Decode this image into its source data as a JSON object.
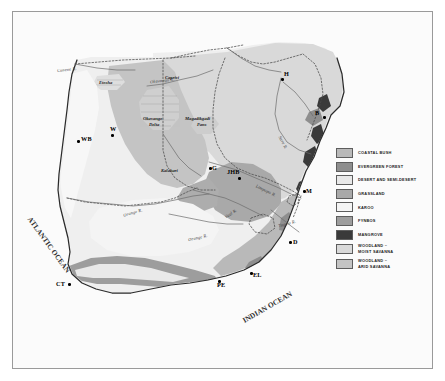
{
  "map": {
    "title": "Southern Africa Vegetation Map",
    "oceans": [
      {
        "name": "atlantic",
        "text": "ATLANTIC OCEAN"
      },
      {
        "name": "indian",
        "text": "INDIAN OCEAN"
      }
    ],
    "rivers": [
      {
        "label": "Cunene R.",
        "x": 44,
        "y": 57
      },
      {
        "label": "Okavango R.",
        "x": 137,
        "y": 70
      },
      {
        "label": "Save R.",
        "x": 266,
        "y": 132
      },
      {
        "label": "Limpopo R.",
        "x": 243,
        "y": 178
      },
      {
        "label": "Vaal R.",
        "x": 212,
        "y": 203
      },
      {
        "label": "Tugela R.",
        "x": 268,
        "y": 212
      },
      {
        "label": "Orange R.",
        "x": 112,
        "y": 201
      },
      {
        "label": "Orange R.",
        "x": 176,
        "y": 226
      }
    ],
    "features": [
      {
        "label": "Etosha",
        "x": 92,
        "y": 71
      },
      {
        "label": "Caprivi",
        "x": 157,
        "y": 72
      },
      {
        "label": "Okavango",
        "x": 142,
        "y": 112
      },
      {
        "label": "Delta",
        "x": 146,
        "y": 118
      },
      {
        "label": "Magadikgadi",
        "x": 186,
        "y": 113
      },
      {
        "label": "Pans",
        "x": 194,
        "y": 119
      },
      {
        "label": "Kalahari",
        "x": 152,
        "y": 160
      }
    ],
    "cities": [
      {
        "code": "WB",
        "x": 64,
        "y": 128,
        "dx": 4,
        "dy": -1
      },
      {
        "code": "W",
        "x": 98,
        "y": 122,
        "dx": -1,
        "dy": -7
      },
      {
        "code": "H",
        "x": 268,
        "y": 66,
        "dx": 3,
        "dy": -6
      },
      {
        "code": "B",
        "x": 310,
        "y": 104,
        "dx": -8,
        "dy": -5
      },
      {
        "code": "G",
        "x": 196,
        "y": 155,
        "dx": 3,
        "dy": -1
      },
      {
        "code": "JHB",
        "x": 225,
        "y": 165,
        "dx": -9,
        "dy": -7
      },
      {
        "code": "M",
        "x": 290,
        "y": 178,
        "dx": 3,
        "dy": -1
      },
      {
        "code": "D",
        "x": 276,
        "y": 229,
        "dx": 4,
        "dy": -1
      },
      {
        "code": "EL",
        "x": 237,
        "y": 260,
        "dx": 3,
        "dy": 1
      },
      {
        "code": "PE",
        "x": 205,
        "y": 268,
        "dx": 1,
        "dy": 3
      },
      {
        "code": "CT",
        "x": 55,
        "y": 271,
        "dx": -10,
        "dy": -1
      }
    ]
  },
  "legend": {
    "items": [
      {
        "label": "COASTAL BUSH",
        "color": "#b9b9b9"
      },
      {
        "label": "EVERGREEN FOREST",
        "color": "#8e8e8e"
      },
      {
        "label": "DESERT AND SEMI-DESERT",
        "color": "#e8e8e8"
      },
      {
        "label": "GRASSLAND",
        "color": "#a9a9a9"
      },
      {
        "label": "KAROO",
        "color": "#f4f4f4"
      },
      {
        "label": "FYNBOS",
        "color": "#9d9d9d"
      },
      {
        "label": "MANGROVE",
        "color": "#3a3a3a"
      },
      {
        "label": "WOODLAND –\nMOIST SAVANNA",
        "color": "#d9d9d9"
      },
      {
        "label": "WOODLAND –\nARID SAVANNA",
        "color": "#c4c4c4"
      }
    ]
  },
  "colors": {
    "ocean": "#fbfbfb",
    "frame": "#9a9a9a",
    "coast": "#2b2b2b",
    "border_dash": "#4a4a4a"
  }
}
